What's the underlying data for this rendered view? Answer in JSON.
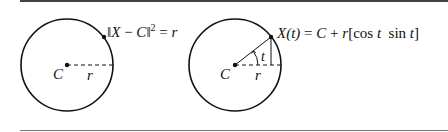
{
  "figure": {
    "left_panel": {
      "equation": {
        "norm_open": "‖",
        "X": "X",
        "minus": " − ",
        "C": "C",
        "norm_close": "‖",
        "power": "2",
        "equals": " = ",
        "r": "r"
      },
      "center_label": "C",
      "radius_label": "r"
    },
    "right_panel": {
      "equation": {
        "lhs": "X(t)",
        "equals": " = ",
        "C": "C",
        "plus": " + ",
        "r": "r",
        "bracket_open": "[",
        "cos": "cos ",
        "t1": "t",
        "sin": "  sin ",
        "t2": "t",
        "bracket_close": "]"
      },
      "center_label": "C",
      "radius_label": "r",
      "angle_label": "t"
    },
    "colors": {
      "stroke": "#111111",
      "rule": "#555555",
      "background": "#ffffff"
    }
  }
}
